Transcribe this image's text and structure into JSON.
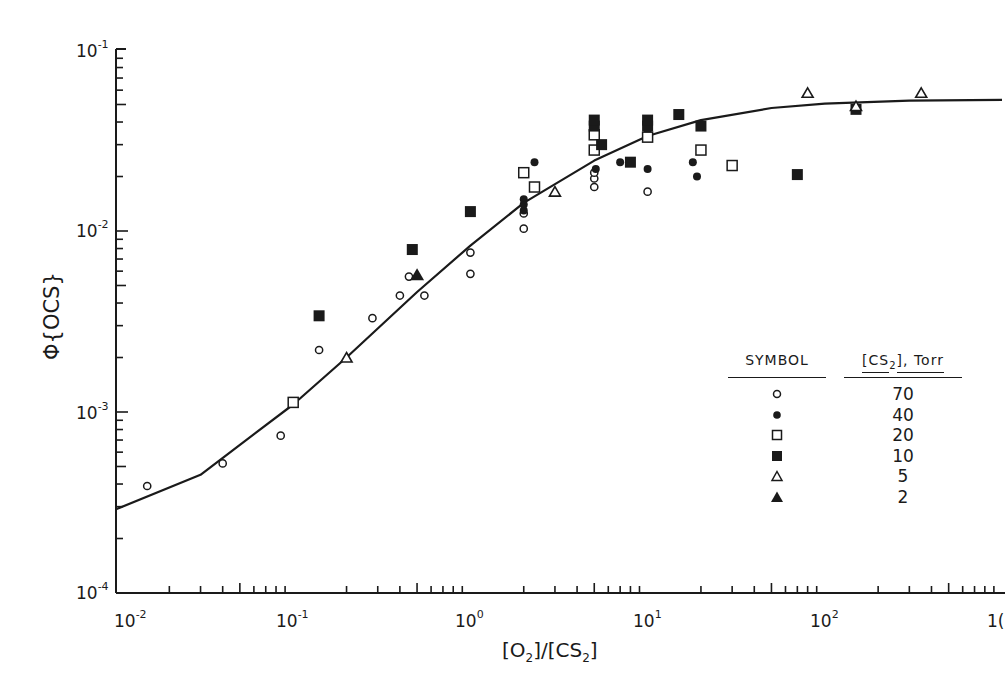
{
  "chart_data": {
    "type": "scatter",
    "title": "",
    "xlabel": "[O2]/[CS2]",
    "ylabel": "Φ{OCS}",
    "xscale": "log",
    "yscale": "log",
    "xlim": [
      0.01,
      1000
    ],
    "ylim": [
      0.0001,
      0.1
    ],
    "x_tick_labels": [
      "10^-2",
      "10^-1",
      "10^0",
      "10^1",
      "10^2",
      "10^3"
    ],
    "y_tick_labels": [
      "10^-4",
      "10^-3",
      "10^-2",
      "10^-1"
    ],
    "grid": false,
    "legend_position": "lower right (inside)",
    "legend_header": [
      "SYMBOL",
      "[CS2], Torr"
    ],
    "series": [
      {
        "name": "70",
        "marker": "open-circle",
        "points": [
          [
            0.015,
            0.00039
          ],
          [
            0.04,
            0.00052
          ],
          [
            0.085,
            0.00074
          ],
          [
            0.14,
            0.0022
          ],
          [
            0.28,
            0.0033
          ],
          [
            0.4,
            0.0044
          ],
          [
            0.45,
            0.0056
          ],
          [
            0.55,
            0.0044
          ],
          [
            1.0,
            0.0076
          ],
          [
            1.0,
            0.0058
          ],
          [
            2.0,
            0.0103
          ],
          [
            2.0,
            0.0125
          ],
          [
            5.0,
            0.0175
          ],
          [
            5.0,
            0.0195
          ],
          [
            5.0,
            0.021
          ],
          [
            5.0,
            0.035
          ],
          [
            10.0,
            0.0165
          ]
        ]
      },
      {
        "name": "40",
        "marker": "filled-circle",
        "points": [
          [
            2.0,
            0.013
          ],
          [
            2.0,
            0.014
          ],
          [
            2.0,
            0.015
          ],
          [
            2.3,
            0.024
          ],
          [
            5.1,
            0.022
          ],
          [
            7.0,
            0.024
          ],
          [
            10.0,
            0.022
          ],
          [
            10.0,
            0.036
          ],
          [
            18.0,
            0.024
          ],
          [
            19.0,
            0.02
          ]
        ]
      },
      {
        "name": "20",
        "marker": "open-square",
        "points": [
          [
            0.1,
            0.00113
          ],
          [
            2.0,
            0.021
          ],
          [
            2.3,
            0.0175
          ],
          [
            5.0,
            0.028
          ],
          [
            5.0,
            0.034
          ],
          [
            10.0,
            0.033
          ],
          [
            20.0,
            0.028
          ],
          [
            30.0,
            0.023
          ]
        ]
      },
      {
        "name": "10",
        "marker": "filled-square",
        "points": [
          [
            0.14,
            0.0034
          ],
          [
            0.47,
            0.0079
          ],
          [
            1.0,
            0.0128
          ],
          [
            5.0,
            0.038
          ],
          [
            5.0,
            0.041
          ],
          [
            5.5,
            0.03
          ],
          [
            8.0,
            0.024
          ],
          [
            10.0,
            0.038
          ],
          [
            10.0,
            0.041
          ],
          [
            15.0,
            0.044
          ],
          [
            20.0,
            0.038
          ],
          [
            70.0,
            0.0205
          ],
          [
            150.0,
            0.047
          ]
        ]
      },
      {
        "name": "5",
        "marker": "open-triangle",
        "points": [
          [
            0.2,
            0.002
          ],
          [
            3.0,
            0.0165
          ],
          [
            80.0,
            0.058
          ],
          [
            150.0,
            0.049
          ],
          [
            350.0,
            0.058
          ]
        ]
      },
      {
        "name": "2",
        "marker": "filled-triangle",
        "points": [
          [
            0.5,
            0.0057
          ]
        ]
      }
    ],
    "fit_curve": {
      "name": "model fit",
      "style": "solid line",
      "points": [
        [
          0.01,
          0.00029
        ],
        [
          0.03,
          0.00045
        ],
        [
          0.1,
          0.0011
        ],
        [
          0.2,
          0.002
        ],
        [
          0.5,
          0.0046
        ],
        [
          1.0,
          0.0083
        ],
        [
          2.0,
          0.0143
        ],
        [
          5.0,
          0.0245
        ],
        [
          10.0,
          0.0335
        ],
        [
          20.0,
          0.041
        ],
        [
          50.0,
          0.0478
        ],
        [
          100.0,
          0.0505
        ],
        [
          300.0,
          0.0525
        ],
        [
          1000.0,
          0.053
        ]
      ]
    }
  },
  "axes": {
    "x_ticks": [
      {
        "base": "10",
        "exp": "-2"
      },
      {
        "base": "10",
        "exp": "-1"
      },
      {
        "base": "10",
        "exp": "0"
      },
      {
        "base": "10",
        "exp": "1"
      },
      {
        "base": "10",
        "exp": "2"
      },
      {
        "base": "1(",
        "exp": ""
      }
    ],
    "y_ticks": [
      {
        "base": "10",
        "exp": "-1"
      },
      {
        "base": "10",
        "exp": "-2"
      },
      {
        "base": "10",
        "exp": "-3"
      },
      {
        "base": "10",
        "exp": "-4"
      }
    ],
    "xlabel_parts": {
      "o2": "O",
      "o2_sub": "2",
      "cs2": "CS",
      "cs2_sub": "2"
    },
    "ylabel": "Φ{OCS}"
  },
  "legend": {
    "header_symbol": "SYMBOL",
    "header_value_prefix": "[CS",
    "header_value_sub": "2",
    "header_value_suffix": "], Torr",
    "rows": [
      {
        "marker": "open-circle",
        "value": "70"
      },
      {
        "marker": "filled-circle",
        "value": "40"
      },
      {
        "marker": "open-square",
        "value": "20"
      },
      {
        "marker": "filled-square",
        "value": "10"
      },
      {
        "marker": "open-triangle",
        "value": "5"
      },
      {
        "marker": "filled-triangle",
        "value": "2"
      }
    ]
  },
  "colors": {
    "ink": "#1a1a1a",
    "paper": "#ffffff"
  }
}
